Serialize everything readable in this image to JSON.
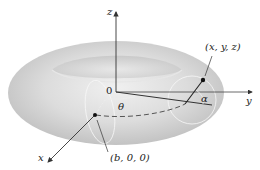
{
  "figure": {
    "type": "torus-parametrization-diagram",
    "colors": {
      "background": "#ffffff",
      "torus_light": "#ececec",
      "torus_mid": "#d4d4d4",
      "torus_dark": "#b8b8b8",
      "axis": "#333333",
      "guide": "#f5f5f5"
    },
    "axes": {
      "z_label": "z",
      "y_label": "y",
      "x_label": "x",
      "origin_label": "0"
    },
    "angles": {
      "theta": "θ",
      "alpha": "α"
    },
    "points": {
      "center_point": "(b, 0, 0)",
      "surface_point": "(x, y, z)"
    }
  }
}
